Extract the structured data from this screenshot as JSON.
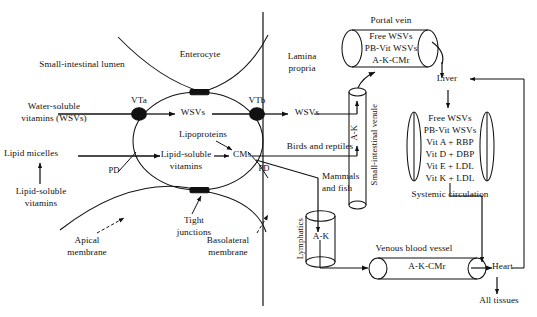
{
  "diagram": {
    "type": "biological-pathway-diagram",
    "background_color": "#ffffff",
    "line_color": "#111111"
  },
  "compartments": {
    "lumen_label": "Small-intestinal lumen",
    "enterocyte_label": "Enterocyte",
    "lamina_propria_label": "Lamina\npropria",
    "lamina_propria_line1": "Lamina",
    "lamina_propria_line2": "propria"
  },
  "lumen_inputs": {
    "wsv_line1": "Water-soluble",
    "wsv_line2": "vitamins (WSVs)",
    "lipid_micelles": "Lipid micelles",
    "lsv_line1": "Lipid-soluble",
    "lsv_line2": "vitamins"
  },
  "enterocyte": {
    "transporter_apical": "VTa",
    "transporter_basolateral": "VTb",
    "wsvs_internal": "WSVs",
    "lipoproteins": "Lipoproteins",
    "lsv_internal_line1": "Lipid-soluble",
    "lsv_internal_line2": "vitamins",
    "chylomicrons": "CMs",
    "passive_diffusion_apical": "PD",
    "passive_diffusion_basolateral": "PD"
  },
  "membranes": {
    "tight_junctions_line1": "Tight",
    "tight_junctions_line2": "junctions",
    "apical_line1": "Apical",
    "apical_line2": "membrane",
    "basolateral_line1": "Basolateral",
    "basolateral_line2": "membrane"
  },
  "lamina_propria": {
    "wsvs_exported": "WSVs",
    "birds_and_reptiles": "Birds and reptiles",
    "mammals_and_fish_line1": "Mammals",
    "mammals_and_fish_line2": "and fish"
  },
  "vessels": {
    "portal_vein": {
      "label": "Portal vein",
      "contents": [
        "Free WSVs",
        "PB-Vit WSVs",
        "A-K-CMr"
      ]
    },
    "small_intestinal_venule": {
      "label": "Small-intestinal venule",
      "contents": [
        "A-K"
      ]
    },
    "systemic_circulation": {
      "label": "Systemic circulation",
      "contents": [
        "Free WSVs",
        "PB-Vit WSVs",
        "Vit A + RBP",
        "Vit D + DBP",
        "Vit E + LDL",
        "Vit K + LDL"
      ]
    },
    "lymphatics": {
      "label": "Lymphatics",
      "contents": [
        "A-K"
      ]
    },
    "venous_blood_vessel": {
      "label": "Venous blood vessel",
      "contents": [
        "A-K-CMr"
      ]
    }
  },
  "organs": {
    "liver": "Liver",
    "heart": "Heart",
    "all_tissues": "All tissues"
  }
}
